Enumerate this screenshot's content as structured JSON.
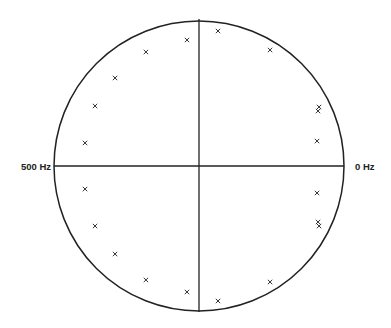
{
  "chart_data": {
    "type": "scatter",
    "title": "",
    "axis_labels": {
      "left": "500 Hz",
      "right": "0 Hz"
    },
    "marker_symbol": "x",
    "unit_circle": true,
    "points": [
      {
        "re": -0.083,
        "im": 0.869
      },
      {
        "re": -0.366,
        "im": 0.786
      },
      {
        "re": -0.579,
        "im": 0.607
      },
      {
        "re": -0.717,
        "im": 0.414
      },
      {
        "re": -0.786,
        "im": 0.159
      },
      {
        "re": 0.131,
        "im": 0.931
      },
      {
        "re": 0.49,
        "im": 0.8
      },
      {
        "re": 0.828,
        "im": 0.407
      },
      {
        "re": 0.821,
        "im": 0.379
      },
      {
        "re": 0.814,
        "im": 0.172
      },
      {
        "re": -0.786,
        "im": -0.159
      },
      {
        "re": -0.717,
        "im": -0.414
      },
      {
        "re": -0.579,
        "im": -0.607
      },
      {
        "re": -0.366,
        "im": -0.786
      },
      {
        "re": -0.083,
        "im": -0.869
      },
      {
        "re": 0.131,
        "im": -0.931
      },
      {
        "re": 0.49,
        "im": -0.8
      },
      {
        "re": 0.814,
        "im": -0.186
      },
      {
        "re": 0.821,
        "im": -0.386
      },
      {
        "re": 0.828,
        "im": -0.414
      }
    ],
    "xlim": [
      -1,
      1
    ],
    "ylim": [
      -1,
      1
    ]
  }
}
